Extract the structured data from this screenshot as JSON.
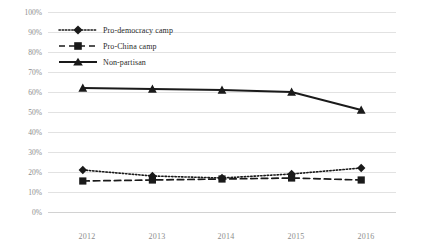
{
  "chart_data": {
    "type": "line",
    "title": "",
    "xlabel": "",
    "ylabel": "",
    "categories": [
      "2012",
      "2013",
      "2014",
      "2015",
      "2016"
    ],
    "x": [
      2012,
      2013,
      2014,
      2015,
      2016
    ],
    "ylim": [
      0,
      100
    ],
    "ytick_labels": [
      "0%",
      "10%",
      "20%",
      "30%",
      "40%",
      "50%",
      "60%",
      "70%",
      "80%",
      "90%",
      "100%"
    ],
    "ytick_values": [
      0,
      10,
      20,
      30,
      40,
      50,
      60,
      70,
      80,
      90,
      100
    ],
    "grid": true,
    "legend_position": "upper-left-inside",
    "series": [
      {
        "name": "Pro-democracy camp",
        "values": [
          21,
          18,
          17,
          19,
          22
        ],
        "marker": "diamond",
        "line_style": "dotted",
        "color": "#1a1a1a"
      },
      {
        "name": "Pro-China camp",
        "values": [
          15.5,
          16,
          16.5,
          17,
          16
        ],
        "marker": "square",
        "line_style": "dashed",
        "color": "#1a1a1a"
      },
      {
        "name": "Non-partisan",
        "values": [
          62,
          61.5,
          61,
          60,
          51
        ],
        "marker": "triangle",
        "line_style": "solid",
        "color": "#1a1a1a"
      }
    ]
  },
  "axis": {
    "y_labels": [
      "100%",
      "90%",
      "80%",
      "70%",
      "60%",
      "50%",
      "40%",
      "30%",
      "20%",
      "10%",
      "0%"
    ],
    "x_labels": [
      "2012",
      "2013",
      "2014",
      "2015",
      "2016"
    ]
  },
  "legend": {
    "items": [
      {
        "label": "Pro-democracy camp",
        "marker": "diamond-marker",
        "line": "dotted"
      },
      {
        "label": "Pro-China camp",
        "marker": "square-marker",
        "line": "dashed"
      },
      {
        "label": "Non-partisan",
        "marker": "triangle-marker",
        "line": "solid"
      }
    ]
  },
  "colors": {
    "ink": "#1a1a1a",
    "grid": "#e2e2e2",
    "tick_text": "#8d8d8d",
    "background": "#ffffff"
  }
}
